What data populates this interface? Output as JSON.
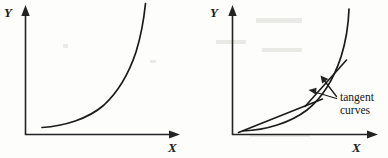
{
  "figure": {
    "title": "",
    "panels": [
      {
        "id": "left-panel",
        "name": "plain-exponential-curve",
        "y_axis_label": "Y",
        "x_axis_label": "X",
        "curve_description": "increasing convex curve",
        "origin": [
          25,
          135
        ],
        "x_axis_end": [
          180,
          135
        ],
        "y_axis_top": [
          25,
          8
        ],
        "curve_path": "M 42 127 C 70 124, 100 110, 120 85 C 134 66, 142 35, 145 4",
        "annotations": []
      },
      {
        "id": "right-panel",
        "name": "exponential-curve-with-tangents",
        "y_axis_label": "Y",
        "x_axis_label": "X",
        "curve_description": "increasing convex curve with two tangent lines",
        "origin": [
          232,
          135
        ],
        "x_axis_end": [
          378,
          135
        ],
        "y_axis_top": [
          232,
          8
        ],
        "curve_path": "M 242 130 C 272 126, 300 112, 320 86 C 336 64, 344 34, 348 10",
        "tangents": [
          {
            "name": "lower-tangent-line",
            "path": "M 238 132 L 320 100"
          },
          {
            "name": "upper-tangent-line",
            "path": "M 306 105 L 345 62"
          }
        ],
        "annotations": [
          {
            "name": "tangent-curves-label",
            "line1": "tangent",
            "line2": "curves",
            "position": [
              340,
              101
            ],
            "pointers": [
              {
                "name": "pointer-to-upper-tangent",
                "from": [
                  337,
                  96
                ],
                "to": [
                  322,
                  78
                ]
              },
              {
                "name": "pointer-to-lower-tangent",
                "from": [
                  337,
                  98
                ],
                "to": [
                  310,
                  92
                ]
              }
            ]
          }
        ]
      }
    ],
    "colors": {
      "ink": "#1b1b1b",
      "axis": "#232323",
      "background": "#fdfdfc"
    }
  }
}
